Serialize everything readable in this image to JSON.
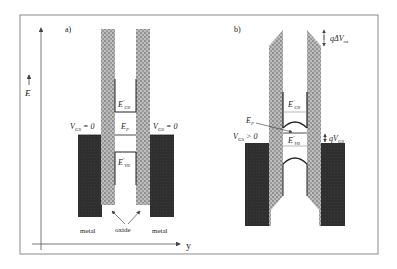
{
  "figure": {
    "panels": [
      {
        "id": "a",
        "label": "a)",
        "axis_e_label": "E",
        "axis_y_label": "y",
        "left_bias": "V_GS = 0",
        "right_bias": "V_GS = 0",
        "conduction_band": "E'_C0",
        "fermi_level": "E_F",
        "valence_band": "E'_V0",
        "material_labels": [
          "metal",
          "oxide",
          "metal"
        ]
      },
      {
        "id": "b",
        "label": "b)",
        "left_bias": "V_GS > 0",
        "right_shift": "qV_GS",
        "top_shift": "qΔV_ox",
        "conduction_band": "E'_C0",
        "fermi_level": "E_F",
        "valence_band": "E'_V0"
      }
    ],
    "colors": {
      "metal": "#2e2e2e",
      "oxide": "#a8a8a8",
      "frame": "#8a8a8a",
      "line": "#333333"
    }
  }
}
